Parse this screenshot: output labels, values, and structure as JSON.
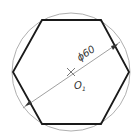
{
  "diagram": {
    "circle": {
      "cx": 71,
      "cy": 72,
      "r": 59,
      "stroke": "#9a9a9a"
    },
    "hexagon": {
      "points": [
        [
          42,
          20
        ],
        [
          101,
          20
        ],
        [
          129,
          72
        ],
        [
          101,
          124
        ],
        [
          42,
          124
        ],
        [
          13,
          72
        ]
      ],
      "stroke": "#1a1a1a"
    },
    "dimension": {
      "label": "ϕ60",
      "from": [
        23,
        108
      ],
      "to": [
        120,
        42
      ],
      "arrow_a": [
        26,
        105
      ],
      "arrow_b": [
        118,
        44
      ]
    },
    "center": {
      "label": "O",
      "subscript": "1",
      "x": 71,
      "y": 72
    }
  }
}
